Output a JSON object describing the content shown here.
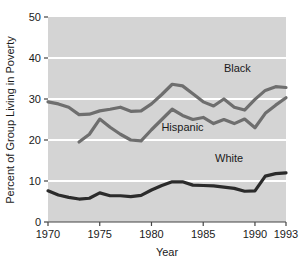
{
  "chart_data": {
    "type": "line",
    "title": "",
    "subtitle": "",
    "xlabel": "Year",
    "ylabel": "Percent of Group Living in Poverty",
    "xlim": [
      1970,
      1993
    ],
    "ylim": [
      0,
      50
    ],
    "xticks": [
      1970,
      1975,
      1980,
      1985,
      1990,
      1993
    ],
    "xtick_labels": [
      "1970",
      "1975",
      "1980",
      "1985",
      "1990",
      "1993"
    ],
    "yticks": [
      0,
      10,
      20,
      30,
      40,
      50
    ],
    "ytick_labels": [
      "0",
      "10",
      "20",
      "30",
      "40",
      "50"
    ],
    "grid": "horizontal white gridlines at 10, 20, 30, 40",
    "legend_position": "inline labels at end of each series",
    "plot_background": "#d4d4d4",
    "series": [
      {
        "name": "Black",
        "label": "Black",
        "color": "#6e6e6e",
        "label_x": 1988.3,
        "label_y": 36.6,
        "x": [
          1970,
          1971,
          1972,
          1973,
          1974,
          1975,
          1976,
          1977,
          1978,
          1979,
          1980,
          1981,
          1982,
          1983,
          1984,
          1985,
          1986,
          1987,
          1988,
          1989,
          1990,
          1991,
          1992,
          1993
        ],
        "values": [
          29.3,
          28.8,
          28.0,
          26.2,
          26.3,
          27.1,
          27.5,
          28.0,
          27.0,
          27.1,
          28.8,
          31.1,
          33.6,
          33.2,
          31.3,
          29.3,
          28.3,
          30.0,
          28.0,
          27.3,
          29.9,
          32.1,
          33.0,
          32.8
        ]
      },
      {
        "name": "Hispanic",
        "label": "Hispanic",
        "color": "#6e6e6e",
        "label_x": 1983.0,
        "label_y": 22.1,
        "x": [
          1973,
          1974,
          1975,
          1976,
          1977,
          1978,
          1979,
          1980,
          1981,
          1982,
          1983,
          1984,
          1985,
          1986,
          1987,
          1988,
          1989,
          1990,
          1991,
          1992,
          1993
        ],
        "values": [
          19.5,
          21.4,
          25.1,
          23.1,
          21.4,
          20.0,
          19.8,
          22.5,
          25.0,
          27.5,
          26.0,
          25.0,
          25.5,
          24.0,
          25.0,
          24.0,
          25.1,
          23.0,
          26.5,
          28.5,
          30.3
        ]
      },
      {
        "name": "White",
        "label": "White",
        "color": "#2b2b2b",
        "label_x": 1987.5,
        "label_y": 14.6,
        "x": [
          1970,
          1971,
          1972,
          1973,
          1974,
          1975,
          1976,
          1977,
          1978,
          1979,
          1980,
          1981,
          1982,
          1983,
          1984,
          1985,
          1986,
          1987,
          1988,
          1989,
          1990,
          1991,
          1992,
          1993
        ],
        "values": [
          7.6,
          6.6,
          6.0,
          5.6,
          5.8,
          7.1,
          6.4,
          6.4,
          6.2,
          6.5,
          7.8,
          8.9,
          9.8,
          9.8,
          9.0,
          8.9,
          8.8,
          8.5,
          8.2,
          7.5,
          7.6,
          11.2,
          11.8,
          12.0
        ]
      }
    ]
  }
}
